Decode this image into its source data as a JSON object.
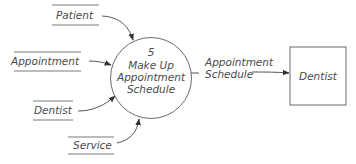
{
  "diagram": {
    "type": "data-flow-diagram",
    "process": {
      "number": "5",
      "label_line1": "Make Up",
      "label_line2": "Appointment",
      "label_line3": "Schedule"
    },
    "data_stores": [
      {
        "label": "Patient"
      },
      {
        "label": "Appointment"
      },
      {
        "label": "Dentist"
      },
      {
        "label": "Service"
      }
    ],
    "external_entity": {
      "label": "Dentist"
    },
    "output_flow": {
      "label_line1": "Appointment",
      "label_line2": "Schedule"
    },
    "colors": {
      "text": "#4a4a4a",
      "lines": "#6a6a6a",
      "background": "#ffffff"
    }
  }
}
